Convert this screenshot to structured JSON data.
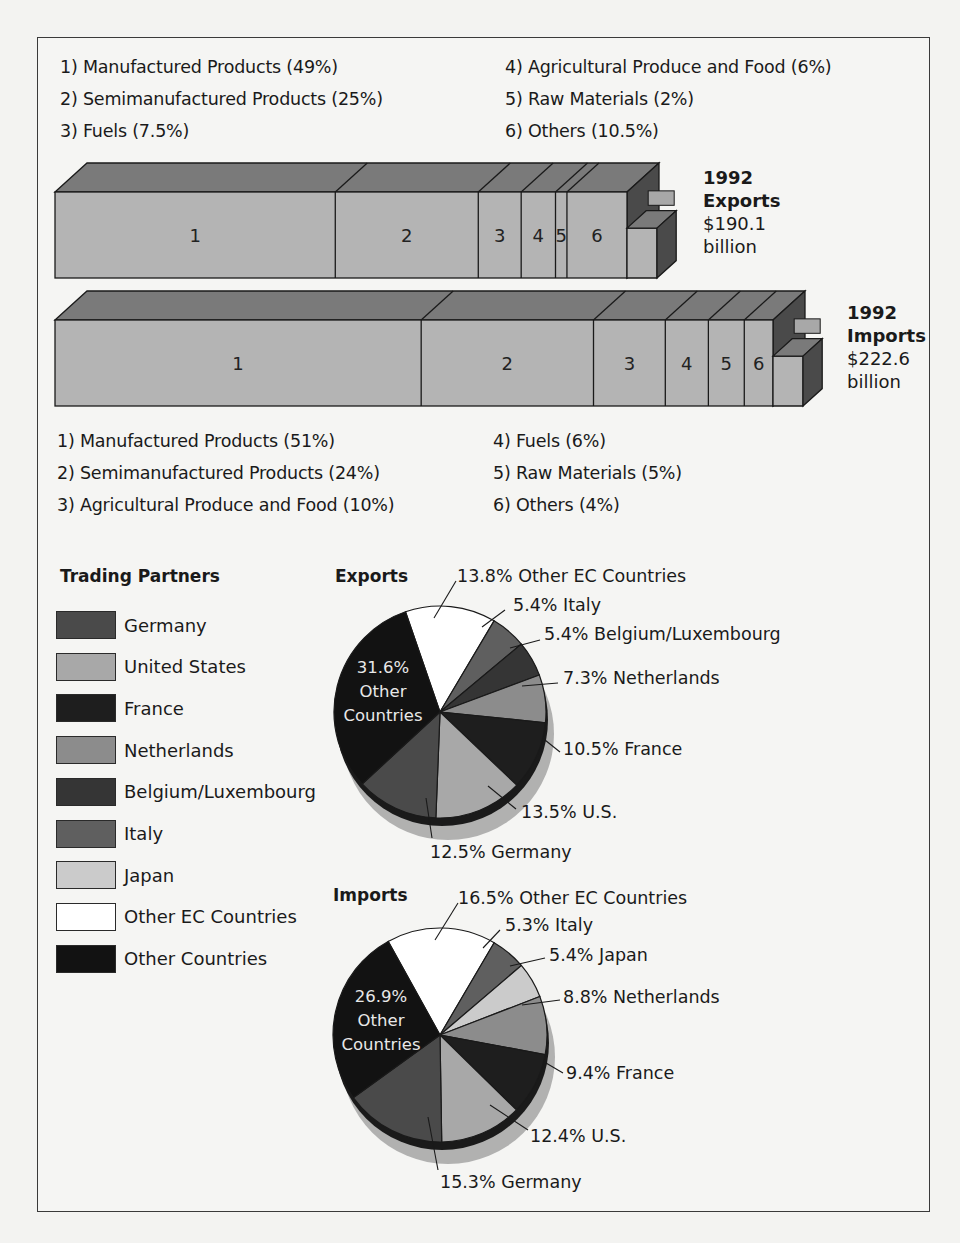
{
  "chart_data": [
    {
      "type": "bar",
      "title": "1992 Exports",
      "subtitle": "$190.1 billion",
      "orientation": "horizontal-stacked-3d",
      "categories": [
        "Manufactured Products",
        "Semimanufactured Products",
        "Fuels",
        "Agricultural Produce and Food",
        "Raw Materials",
        "Others"
      ],
      "segment_numbers": [
        "1",
        "2",
        "3",
        "4",
        "5",
        "6"
      ],
      "values": [
        49,
        25,
        7.5,
        6,
        2,
        10.5
      ],
      "unit": "%"
    },
    {
      "type": "bar",
      "title": "1992 Imports",
      "subtitle": "$222.6 billion",
      "orientation": "horizontal-stacked-3d",
      "categories": [
        "Manufactured Products",
        "Semimanufactured Products",
        "Agricultural Produce and Food",
        "Fuels",
        "Raw Materials",
        "Others"
      ],
      "segment_numbers": [
        "1",
        "2",
        "3",
        "4",
        "5",
        "6"
      ],
      "values": [
        51,
        24,
        10,
        6,
        5,
        4
      ],
      "unit": "%"
    },
    {
      "type": "pie",
      "title": "Exports",
      "categories": [
        "Other EC Countries",
        "Italy",
        "Belgium/Luxembourg",
        "Netherlands",
        "France",
        "U.S.",
        "Germany",
        "Other Countries"
      ],
      "values": [
        13.8,
        5.4,
        5.4,
        7.3,
        10.5,
        13.5,
        12.5,
        31.6
      ],
      "unit": "%"
    },
    {
      "type": "pie",
      "title": "Imports",
      "categories": [
        "Other EC Countries",
        "Italy",
        "Japan",
        "Netherlands",
        "France",
        "U.S.",
        "Germany",
        "Other Countries"
      ],
      "values": [
        16.5,
        5.3,
        5.4,
        8.8,
        9.4,
        12.4,
        15.3,
        26.9
      ],
      "unit": "%"
    }
  ],
  "exports_legend": [
    "1) Manufactured Products (49%)",
    "2) Semimanufactured Products (25%)",
    "3) Fuels (7.5%)",
    "4) Agricultural Produce and Food (6%)",
    "5) Raw Materials (2%)",
    "6) Others (10.5%)"
  ],
  "exports_bar": {
    "year": "1992",
    "label": "Exports",
    "amount": "$190.1",
    "unit": "billion",
    "segments": [
      "1",
      "2",
      "3",
      "4",
      "5",
      "6"
    ]
  },
  "imports_bar": {
    "year": "1992",
    "label": "Imports",
    "amount": "$222.6",
    "unit": "billion",
    "segments": [
      "1",
      "2",
      "3",
      "4",
      "5",
      "6"
    ]
  },
  "imports_legend": [
    "1) Manufactured Products (51%)",
    "2) Semimanufactured Products (24%)",
    "3) Agricultural Produce and Food (10%)",
    "4) Fuels (6%)",
    "5) Raw Materials (5%)",
    "6) Others (4%)"
  ],
  "trading_partners": {
    "title": "Trading Partners",
    "items": [
      {
        "label": "Germany",
        "color": "#4a4a4a"
      },
      {
        "label": "United States",
        "color": "#a8a8a8"
      },
      {
        "label": "France",
        "color": "#1e1e1e"
      },
      {
        "label": "Netherlands",
        "color": "#8c8c8c"
      },
      {
        "label": "Belgium/Luxembourg",
        "color": "#353535"
      },
      {
        "label": "Italy",
        "color": "#5f5f5f"
      },
      {
        "label": "Japan",
        "color": "#cbcbcb"
      },
      {
        "label": "Other EC Countries",
        "color": "#ffffff"
      },
      {
        "label": "Other Countries",
        "color": "#121212"
      }
    ]
  },
  "exports_pie": {
    "title": "Exports",
    "inner_pct": "31.6%",
    "inner_l1": "Other",
    "inner_l2": "Countries",
    "callouts": [
      "13.8% Other EC Countries",
      "5.4% Italy",
      "5.4% Belgium/Luxembourg",
      "7.3% Netherlands",
      "10.5% France",
      "13.5% U.S.",
      "12.5% Germany"
    ],
    "colors": [
      "#ffffff",
      "#5f5f5f",
      "#353535",
      "#8c8c8c",
      "#1e1e1e",
      "#a8a8a8",
      "#4a4a4a",
      "#121212"
    ]
  },
  "imports_pie": {
    "title": "Imports",
    "inner_pct": "26.9%",
    "inner_l1": "Other",
    "inner_l2": "Countries",
    "callouts": [
      "16.5% Other EC Countries",
      "5.3% Italy",
      "5.4% Japan",
      "8.8% Netherlands",
      "9.4% France",
      "12.4% U.S.",
      "15.3% Germany"
    ],
    "colors": [
      "#ffffff",
      "#5f5f5f",
      "#cbcbcb",
      "#8c8c8c",
      "#1e1e1e",
      "#a8a8a8",
      "#4a4a4a",
      "#121212"
    ]
  },
  "colors": {
    "bar_front": "#b4b4b4",
    "bar_top": "#7a7a7a",
    "bar_side": "#4a4a4a",
    "outline": "#1a1a1a",
    "pie_shadow": "#9a9a9a"
  }
}
